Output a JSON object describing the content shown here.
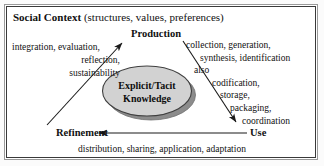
{
  "figure": {
    "type": "cycle-diagram"
  },
  "frame": {
    "header_bold": "Social Context",
    "header_rest": " (structures, values, preferences)",
    "border_color": "#3a3a3a",
    "background": "#ffffff"
  },
  "nodes": {
    "production": "Production",
    "use": "Use",
    "refinement": "Refinement"
  },
  "center": {
    "line1": "Explicit/Tacit",
    "line2": "Knowledge",
    "fill_color": "#d2d2d2",
    "shadow_color": "#8c8c8c",
    "stroke_color": "#3f3f3f"
  },
  "annotations": {
    "left": {
      "attached_to": "refinement-to-production",
      "lines": [
        "integration, evaluation,",
        "reflection,",
        "sustainability"
      ]
    },
    "right": {
      "attached_to": "production-to-use",
      "lines": [
        "collection, generation,",
        "synthesis, identification",
        "also",
        "codification,",
        "storage,",
        "packaging,",
        "coordination"
      ]
    },
    "bottom": {
      "attached_to": "use-to-refinement",
      "text": "distribution, sharing, application, adaptation"
    }
  },
  "arrows": [
    {
      "name": "refinement-to-production",
      "from": "Refinement",
      "to": "Production",
      "direction": "up-right"
    },
    {
      "name": "production-to-use",
      "from": "Production",
      "to": "Use",
      "direction": "down-right"
    },
    {
      "name": "use-to-refinement",
      "from": "Use",
      "to": "Refinement",
      "direction": "left"
    }
  ],
  "colors": {
    "ink": "#111111",
    "arrow": "#1a1a1a"
  }
}
